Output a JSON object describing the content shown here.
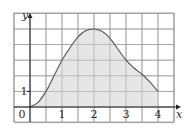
{
  "chart_data": {
    "type": "area",
    "title": "",
    "xlabel": "x",
    "ylabel": "y",
    "xlim": [
      -0.5,
      4.5
    ],
    "ylim": [
      -1,
      6
    ],
    "grid": true,
    "grid_step_x": 0.5,
    "grid_step_y": 1,
    "x_ticks": [
      "0",
      "1",
      "2",
      "3",
      "4"
    ],
    "y_ticks": [
      "1"
    ],
    "origin_label": "0",
    "series": [
      {
        "name": "f(x)",
        "x": [
          0,
          0.25,
          0.5,
          0.75,
          1,
          1.25,
          1.5,
          1.75,
          2,
          2.25,
          2.5,
          2.75,
          3,
          3.25,
          3.5,
          3.75,
          4
        ],
        "values": [
          0,
          0.3,
          1.0,
          2.0,
          3.0,
          3.8,
          4.5,
          4.9,
          5.0,
          4.85,
          4.4,
          3.7,
          3.0,
          2.5,
          2.1,
          1.6,
          1.0
        ]
      }
    ],
    "shaded_region": {
      "from": 0,
      "to": 4,
      "color": "#e6e6e6"
    },
    "colors": {
      "curve": "#555555",
      "grid": "#9a9a9a",
      "axis": "#222222",
      "fill": "#e6e6e6"
    }
  }
}
